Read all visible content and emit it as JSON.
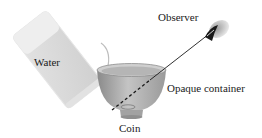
{
  "labels": {
    "water": "Water",
    "observer": "Observer",
    "container": "Opaque container",
    "coin": "Coin"
  },
  "colors": {
    "glass_fill": "#d8d8d8",
    "glass_top": "#ececec",
    "bowl_outer": "#a9a9a9",
    "bowl_inner": "#c8c8c8",
    "line": "#1a1a1a"
  }
}
